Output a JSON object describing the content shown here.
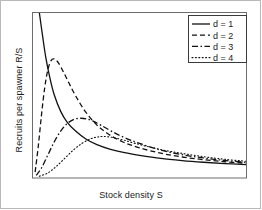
{
  "chart_data": {
    "type": "line",
    "title": "",
    "xlabel": "Stock density S",
    "ylabel": "Recruits per spawner R/S",
    "grid": false,
    "xlim": [
      0,
      10
    ],
    "ylim": [
      0,
      10
    ],
    "axis_ticks": {
      "x": [],
      "y": []
    },
    "legend": {
      "position": "top-right",
      "entries": [
        {
          "label": "d = 1",
          "style": "solid",
          "color": "#111111"
        },
        {
          "label": "d = 2",
          "style": "dashed",
          "color": "#111111"
        },
        {
          "label": "d = 3",
          "style": "dashdot",
          "color": "#111111"
        },
        {
          "label": "d = 4",
          "style": "dotted",
          "color": "#111111"
        }
      ]
    },
    "series": [
      {
        "name": "d = 1",
        "style": "solid",
        "x": [
          0.3,
          0.45,
          0.6,
          0.8,
          1.0,
          1.3,
          1.6,
          2.0,
          2.5,
          3.0,
          3.6,
          4.3,
          5.0,
          6.0,
          7.0,
          8.0,
          9.0,
          10.0
        ],
        "y": [
          10.0,
          8.6,
          7.3,
          6.0,
          5.0,
          4.0,
          3.35,
          2.8,
          2.3,
          1.97,
          1.7,
          1.48,
          1.32,
          1.13,
          1.0,
          0.9,
          0.82,
          0.76
        ]
      },
      {
        "name": "d = 2",
        "style": "dashed",
        "x": [
          0.1,
          0.25,
          0.4,
          0.55,
          0.7,
          0.85,
          1.0,
          1.2,
          1.45,
          1.7,
          2.0,
          2.4,
          2.9,
          3.5,
          4.2,
          5.0,
          6.0,
          7.0,
          8.0,
          9.0,
          10.0
        ],
        "y": [
          0.3,
          1.9,
          3.8,
          5.45,
          6.55,
          7.1,
          7.2,
          6.95,
          6.35,
          5.7,
          4.95,
          4.1,
          3.3,
          2.65,
          2.15,
          1.78,
          1.45,
          1.22,
          1.06,
          0.93,
          0.84
        ]
      },
      {
        "name": "d = 3",
        "style": "dashdot",
        "x": [
          0.15,
          0.4,
          0.7,
          1.0,
          1.3,
          1.6,
          1.9,
          2.2,
          2.5,
          2.8,
          3.2,
          3.7,
          4.3,
          5.0,
          6.0,
          7.0,
          8.0,
          9.0,
          10.0
        ],
        "y": [
          0.1,
          0.55,
          1.35,
          2.15,
          2.8,
          3.25,
          3.5,
          3.58,
          3.55,
          3.42,
          3.15,
          2.78,
          2.4,
          2.05,
          1.64,
          1.36,
          1.16,
          1.01,
          0.89
        ]
      },
      {
        "name": "d = 4",
        "style": "dotted",
        "x": [
          0.3,
          0.7,
          1.1,
          1.5,
          1.9,
          2.3,
          2.7,
          3.0,
          3.3,
          3.7,
          4.2,
          4.8,
          5.5,
          6.2,
          7.0,
          8.0,
          9.0,
          10.0
        ],
        "y": [
          0.05,
          0.25,
          0.65,
          1.15,
          1.65,
          2.05,
          2.33,
          2.43,
          2.47,
          2.42,
          2.27,
          2.05,
          1.82,
          1.62,
          1.44,
          1.24,
          1.08,
          0.96
        ]
      }
    ]
  }
}
